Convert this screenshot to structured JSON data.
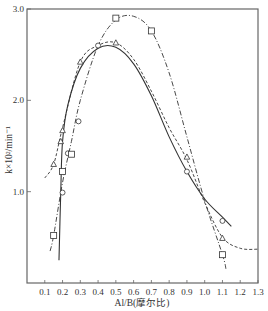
{
  "chart_data": {
    "type": "scatter",
    "title": "",
    "xlabel": "Al/B(摩尔比)",
    "ylabel": "k×10²/min⁻¹",
    "xlim": [
      0.0,
      1.3
    ],
    "ylim": [
      0.0,
      3.0
    ],
    "x_ticks": [
      "0.1",
      "0.2",
      "0.3",
      "0.4",
      "0.5",
      "0.6",
      "0.7",
      "0.8",
      "0.9",
      "1.0",
      "1.1",
      "1.2",
      "1.3"
    ],
    "y_ticks": [
      "1.0",
      "2.0",
      "3.0"
    ],
    "grid": false,
    "legend": null,
    "series": [
      {
        "name": "circles",
        "marker": "circle",
        "line_style": "solid",
        "points": [
          [
            0.2,
            0.99
          ],
          [
            0.23,
            1.42
          ],
          [
            0.29,
            1.77
          ],
          [
            0.4,
            2.6
          ],
          [
            0.9,
            1.22
          ],
          [
            1.1,
            0.68
          ]
        ],
        "curve": [
          [
            0.18,
            0.25
          ],
          [
            0.19,
            1.0
          ],
          [
            0.2,
            1.55
          ],
          [
            0.23,
            1.95
          ],
          [
            0.3,
            2.35
          ],
          [
            0.4,
            2.57
          ],
          [
            0.5,
            2.58
          ],
          [
            0.6,
            2.4
          ],
          [
            0.7,
            2.05
          ],
          [
            0.8,
            1.6
          ],
          [
            0.9,
            1.22
          ],
          [
            1.0,
            0.92
          ],
          [
            1.1,
            0.72
          ],
          [
            1.15,
            0.62
          ]
        ]
      },
      {
        "name": "triangles",
        "marker": "triangle",
        "line_style": "dashed",
        "points": [
          [
            0.15,
            1.3
          ],
          [
            0.19,
            1.55
          ],
          [
            0.2,
            1.67
          ],
          [
            0.3,
            2.42
          ],
          [
            0.5,
            2.63
          ],
          [
            0.9,
            1.38
          ],
          [
            1.1,
            0.49
          ]
        ],
        "curve": [
          [
            0.1,
            1.15
          ],
          [
            0.15,
            1.3
          ],
          [
            0.2,
            1.7
          ],
          [
            0.3,
            2.42
          ],
          [
            0.4,
            2.6
          ],
          [
            0.5,
            2.63
          ],
          [
            0.6,
            2.45
          ],
          [
            0.7,
            2.1
          ],
          [
            0.8,
            1.7
          ],
          [
            0.9,
            1.35
          ],
          [
            1.0,
            0.88
          ],
          [
            1.1,
            0.5
          ],
          [
            1.2,
            0.38
          ],
          [
            1.3,
            0.37
          ]
        ]
      },
      {
        "name": "squares",
        "marker": "square",
        "line_style": "dash-dot",
        "points": [
          [
            0.15,
            0.52
          ],
          [
            0.2,
            1.22
          ],
          [
            0.25,
            1.41
          ],
          [
            0.5,
            2.9
          ],
          [
            0.7,
            2.76
          ],
          [
            1.1,
            0.31
          ]
        ],
        "curve": [
          [
            0.13,
            0.35
          ],
          [
            0.15,
            0.52
          ],
          [
            0.2,
            1.1
          ],
          [
            0.25,
            1.55
          ],
          [
            0.3,
            2.0
          ],
          [
            0.4,
            2.6
          ],
          [
            0.5,
            2.88
          ],
          [
            0.6,
            2.92
          ],
          [
            0.7,
            2.76
          ],
          [
            0.8,
            2.3
          ],
          [
            0.9,
            1.6
          ],
          [
            1.0,
            0.9
          ],
          [
            1.1,
            0.31
          ],
          [
            1.12,
            0.15
          ]
        ]
      }
    ]
  },
  "colors": {
    "axis": "#666666",
    "line": "#333333",
    "background": "#ffffff"
  }
}
